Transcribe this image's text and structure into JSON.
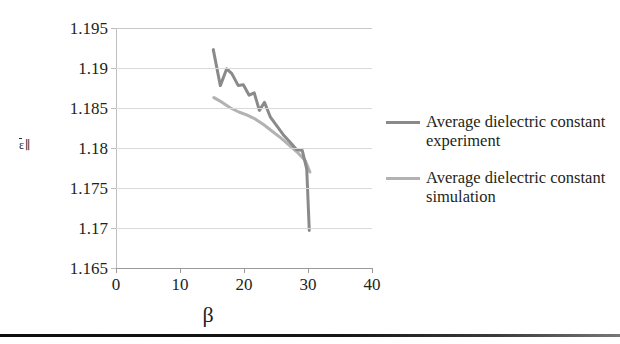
{
  "chart_data": {
    "type": "line",
    "title": "",
    "xlabel": "β",
    "ylabel": "ε̄∥",
    "xlim": [
      0,
      40
    ],
    "ylim": [
      1.165,
      1.195
    ],
    "xticks": [
      0,
      10,
      20,
      30,
      40
    ],
    "yticks": [
      1.195,
      1.19,
      1.185,
      1.18,
      1.175,
      1.17,
      1.165
    ],
    "ytick_labels": [
      "1.195",
      "1.19",
      "1.185",
      "1.18",
      "1.175",
      "1.17",
      "1.165"
    ],
    "xtick_labels": [
      "0",
      "10",
      "20",
      "30",
      "40"
    ],
    "grid": true,
    "grid_axis": "y",
    "legend_position": "right",
    "series": [
      {
        "name": "Average dielectric constant experiment",
        "color": "#8a8a8a",
        "x": [
          15.2,
          16.3,
          17.3,
          18.1,
          19.1,
          19.9,
          20.8,
          21.6,
          22.4,
          23.2,
          24.1,
          25.1,
          26.1,
          27.1,
          28.2,
          29.1,
          29.8,
          30.2
        ],
        "y": [
          1.1923,
          1.1878,
          1.1899,
          1.1893,
          1.1878,
          1.1879,
          1.1866,
          1.1869,
          1.1847,
          1.1857,
          1.1839,
          1.1828,
          1.1817,
          1.1808,
          1.1798,
          1.1797,
          1.1774,
          1.1697
        ]
      },
      {
        "name": "Average dielectric constant simulation",
        "color": "#b2b2b2",
        "x": [
          15.3,
          16.6,
          17.9,
          19.2,
          20.5,
          21.8,
          23.1,
          24.4,
          25.7,
          27.0,
          28.3,
          29.6,
          30.3
        ],
        "y": [
          1.1863,
          1.1857,
          1.185,
          1.1845,
          1.1841,
          1.1836,
          1.1829,
          1.1821,
          1.1813,
          1.1804,
          1.1795,
          1.1784,
          1.177
        ]
      }
    ]
  },
  "legend": {
    "items": [
      {
        "label": "Average dielectric constant experiment",
        "color": "#8a8a8a"
      },
      {
        "label": "Average dielectric constant simulation",
        "color": "#b2b2b2"
      }
    ]
  },
  "axes": {
    "y_title_main": "ε",
    "y_title_sub": "∥",
    "x_title": "β"
  }
}
